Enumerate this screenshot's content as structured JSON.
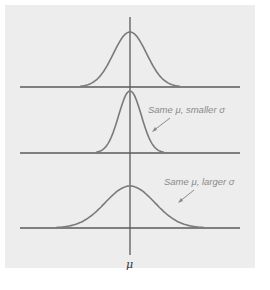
{
  "figure": {
    "annotations": {
      "smaller_sigma": "Same μ, smaller σ",
      "larger_sigma": "Same μ, larger σ"
    },
    "x_axis_label": "μ"
  },
  "colors": {
    "panel_background": "#ededed",
    "curve": "#7a7a7a",
    "axis": "#5a5a5a",
    "annotation_text": "#8a8a8a"
  },
  "chart_data": {
    "type": "line",
    "title": "",
    "xlabel": "μ",
    "ylabel": "",
    "series": [
      {
        "name": "Reference normal",
        "mean": 0,
        "sigma": 1.0
      },
      {
        "name": "Same μ, smaller σ",
        "mean": 0,
        "sigma": 0.65
      },
      {
        "name": "Same μ, larger σ",
        "mean": 0,
        "sigma": 1.5
      }
    ],
    "grid": false
  }
}
